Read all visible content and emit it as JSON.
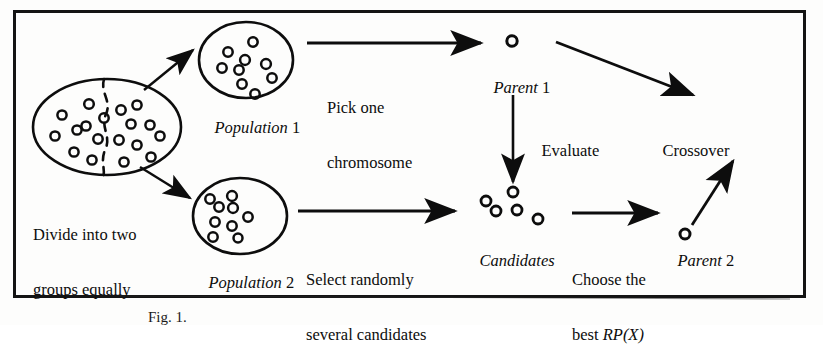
{
  "figure": {
    "caption": "Fig. 1.",
    "border_color": "#141414",
    "ink_color": "#0d0d0d",
    "background": "#fdfdfc",
    "border_box": {
      "x": 14,
      "y": 11,
      "width": 791,
      "height": 286
    }
  },
  "nodes": {
    "main_population": {
      "name": "main-population-ellipse",
      "shape": "ellipse",
      "cx": 107,
      "cy": 127,
      "rx": 74,
      "ry": 48,
      "divider": "dashed-vertical",
      "chromosome_count": 18
    },
    "population_1": {
      "label_italic": "Population",
      "label_roman": " 1",
      "shape": "ellipse",
      "cx": 246,
      "cy": 60,
      "rx": 47,
      "ry": 38,
      "chromosome_count": 9
    },
    "population_2": {
      "label_italic": "Population",
      "label_roman": " 2",
      "shape": "ellipse",
      "cx": 240,
      "cy": 216,
      "rx": 47,
      "ry": 38,
      "chromosome_count": 9
    },
    "parent_1": {
      "label_italic": "Parent",
      "label_roman": " 1",
      "shape": "single-chromosome",
      "cx": 512,
      "cy": 41
    },
    "candidates": {
      "label_italic": "Candidates",
      "shape": "chromosome-cluster",
      "chromosome_count": 5
    },
    "parent_2": {
      "label_italic": "Parent",
      "label_roman": " 2",
      "shape": "single-chromosome",
      "cx": 685,
      "cy": 234
    }
  },
  "labels": {
    "pick_one_chromosome": {
      "line1": "Pick one",
      "line2": "chromosome"
    },
    "divide_into_two_groups": {
      "line1": "Divide into two",
      "line2": "groups equally"
    },
    "select_randomly": {
      "line1": "Select randomly",
      "line2": "several candidates"
    },
    "evaluate": "Evaluate",
    "crossover": "Crossover",
    "choose_the_best": {
      "line1": "Choose the",
      "line2_plain": "best ",
      "line2_italic": "RP(X)"
    }
  },
  "arrows": [
    {
      "name": "arrow-to-population-1",
      "from": "main_population",
      "to": "population_1"
    },
    {
      "name": "arrow-to-population-2",
      "from": "main_population",
      "to": "population_2"
    },
    {
      "name": "arrow-pick-one-chromosome",
      "from": "population_1",
      "to": "parent_1"
    },
    {
      "name": "arrow-parent1-to-crossover",
      "from": "parent_1",
      "to": "crossover"
    },
    {
      "name": "arrow-evaluate",
      "from": "parent_1",
      "to": "candidates"
    },
    {
      "name": "arrow-select-randomly",
      "from": "population_2",
      "to": "candidates"
    },
    {
      "name": "arrow-choose-best",
      "from": "candidates",
      "to": "parent_2"
    },
    {
      "name": "arrow-parent2-to-crossover",
      "from": "parent_2",
      "to": "crossover"
    }
  ]
}
